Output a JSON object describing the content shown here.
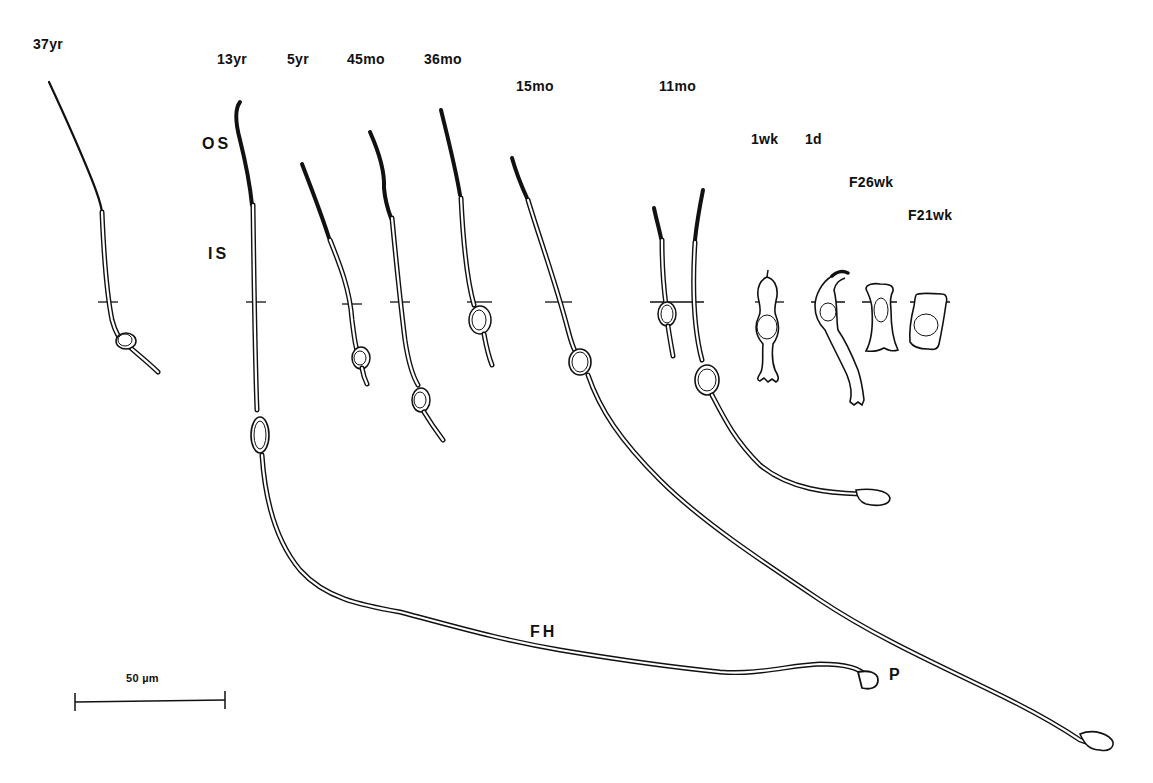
{
  "figure": {
    "type": "photoreceptor morphology line drawing",
    "ages": [
      {
        "id": "37yr",
        "label": "37yr"
      },
      {
        "id": "13yr",
        "label": "13yr"
      },
      {
        "id": "5yr",
        "label": "5yr"
      },
      {
        "id": "45mo",
        "label": "45mo"
      },
      {
        "id": "36mo",
        "label": "36mo"
      },
      {
        "id": "15mo",
        "label": "15mo"
      },
      {
        "id": "11mo",
        "label": "11mo"
      },
      {
        "id": "1wk",
        "label": "1wk"
      },
      {
        "id": "1d",
        "label": "1d"
      },
      {
        "id": "F26wk",
        "label": "F26wk"
      },
      {
        "id": "F21wk",
        "label": "F21wk"
      }
    ],
    "annotations": {
      "outer_segment": "OS",
      "inner_segment": "IS",
      "fiber_of_henle": "FH",
      "pedicle": "P"
    },
    "scale_bar": {
      "label": "50 µm",
      "length_px": 150
    },
    "colors": {
      "ink": "#111111",
      "background": "#ffffff"
    }
  }
}
